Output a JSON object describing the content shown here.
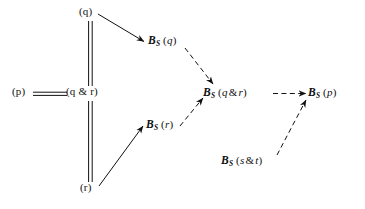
{
  "figure": {
    "background_color": "#ffffff",
    "ink_color": "#111111",
    "width": 365,
    "height": 209
  },
  "nodes": [
    {
      "id": "p",
      "name": "node-p",
      "text": "(p)",
      "parts": {
        "open": "(",
        "body": "p",
        "close": ")"
      },
      "x": 12,
      "y": 90
    },
    {
      "id": "q",
      "name": "node-q",
      "text": "(q)",
      "parts": {
        "open": "(",
        "body": "q",
        "close": ")"
      },
      "x": 79,
      "y": 8
    },
    {
      "id": "qandr",
      "name": "node-q-and-r",
      "text": "(q & r)",
      "parts": {
        "open": "(",
        "left": "q",
        "op": "&",
        "right": "r",
        "close": ")"
      },
      "x": 68,
      "y": 90
    },
    {
      "id": "r",
      "name": "node-r",
      "text": "(r)",
      "parts": {
        "open": "(",
        "body": "r",
        "close": ")"
      },
      "x": 80,
      "y": 184
    },
    {
      "id": "bsq",
      "name": "node-bs-q",
      "text": "B S (q)",
      "parts": {
        "b": "B",
        "sub": "S",
        "open": "(",
        "body": "q",
        "close": ")"
      },
      "x": 148,
      "y": 38
    },
    {
      "id": "bsr",
      "name": "node-bs-r",
      "text": "B S (r)",
      "parts": {
        "b": "B",
        "sub": "S",
        "open": "(",
        "body": "r",
        "close": ")"
      },
      "x": 146,
      "y": 122
    },
    {
      "id": "bsqandr",
      "name": "node-bs-q-and-r",
      "text": "B S (q & r)",
      "parts": {
        "b": "B",
        "sub": "S",
        "open": "(",
        "left": "q",
        "op": "&",
        "right": "r",
        "close": ")"
      },
      "x": 203,
      "y": 90
    },
    {
      "id": "bsp",
      "name": "node-bs-p",
      "text": "B S (p)",
      "parts": {
        "b": "B",
        "sub": "S",
        "open": "(",
        "body": "p",
        "close": ")"
      },
      "x": 308,
      "y": 90
    },
    {
      "id": "bssandt",
      "name": "node-bs-s-and-t",
      "text": "B S (s & t)",
      "parts": {
        "b": "B",
        "sub": "S",
        "open": "(",
        "left": "s",
        "op": "&",
        "right": "t",
        "close": ")"
      },
      "x": 221,
      "y": 158
    }
  ],
  "edges": [
    {
      "id": "e-p-qandr",
      "name": "edge-p-equals-q-and-r",
      "style": "double-line",
      "arrowhead": "none",
      "from": "p",
      "to": "qandr",
      "orientation": "horizontal"
    },
    {
      "id": "e-q-qandr",
      "name": "edge-q-equals-q-and-r",
      "style": "double-line",
      "arrowhead": "none",
      "from": "q",
      "to": "qandr",
      "orientation": "vertical"
    },
    {
      "id": "e-qandr-r",
      "name": "edge-q-and-r-equals-r",
      "style": "double-line",
      "arrowhead": "none",
      "from": "qandr",
      "to": "r",
      "orientation": "vertical"
    },
    {
      "id": "e-q-bsq",
      "name": "edge-q-to-bs-q",
      "style": "solid",
      "arrowhead": "filled",
      "from": "q",
      "to": "bsq"
    },
    {
      "id": "e-r-bsr",
      "name": "edge-r-to-bs-r",
      "style": "solid",
      "arrowhead": "filled",
      "from": "r",
      "to": "bsr"
    },
    {
      "id": "e-bsq-bsqandr",
      "name": "edge-bs-q-to-bs-q-and-r",
      "style": "dashed",
      "arrowhead": "filled",
      "from": "bsq",
      "to": "bsqandr"
    },
    {
      "id": "e-bsr-bsqandr",
      "name": "edge-bs-r-to-bs-q-and-r",
      "style": "dashed",
      "arrowhead": "filled",
      "from": "bsr",
      "to": "bsqandr"
    },
    {
      "id": "e-bsqandr-bsp",
      "name": "edge-bs-q-and-r-to-bs-p",
      "style": "dashed",
      "arrowhead": "filled",
      "from": "bsqandr",
      "to": "bsp"
    },
    {
      "id": "e-bssandt-bsp",
      "name": "edge-bs-s-and-t-to-bs-p",
      "style": "dashed",
      "arrowhead": "filled",
      "from": "bssandt",
      "to": "bsp"
    }
  ]
}
